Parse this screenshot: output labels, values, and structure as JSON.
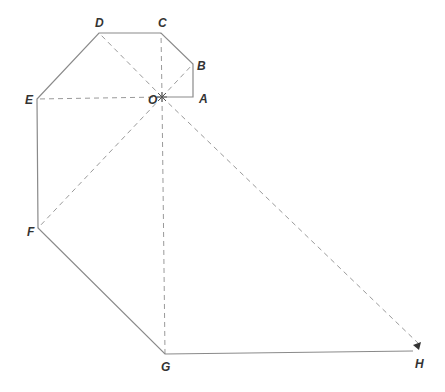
{
  "diagram": {
    "type": "polygon-path-with-radial-dashed-lines",
    "stroke_color": "#8a8a8a",
    "dash_color": "#9a9a9a",
    "label_color": "#333333",
    "center": {
      "label": "O",
      "x": 162,
      "y": 97
    },
    "points": [
      {
        "label": "A",
        "x": 193,
        "y": 97,
        "lx": 199,
        "ly": 103
      },
      {
        "label": "B",
        "x": 193,
        "y": 64,
        "lx": 197,
        "ly": 70
      },
      {
        "label": "C",
        "x": 161,
        "y": 33,
        "lx": 158,
        "ly": 27
      },
      {
        "label": "D",
        "x": 99,
        "y": 33,
        "lx": 95,
        "ly": 27
      },
      {
        "label": "E",
        "x": 37,
        "y": 99,
        "lx": 25,
        "ly": 104
      },
      {
        "label": "F",
        "x": 38,
        "y": 228,
        "lx": 27,
        "ly": 236
      },
      {
        "label": "G",
        "x": 165,
        "y": 354,
        "lx": 161,
        "ly": 371
      },
      {
        "label": "H",
        "x": 413,
        "y": 351,
        "lx": 415,
        "ly": 368
      }
    ],
    "solid_path": [
      "O",
      "A",
      "B",
      "C",
      "D",
      "E",
      "F",
      "G",
      "H"
    ],
    "dashed_rays_from_O": [
      "B",
      "C",
      "D",
      "E",
      "F",
      "G",
      "H"
    ],
    "o_label": {
      "text": "O",
      "x": 148,
      "y": 104
    },
    "arrow_at": "H"
  }
}
